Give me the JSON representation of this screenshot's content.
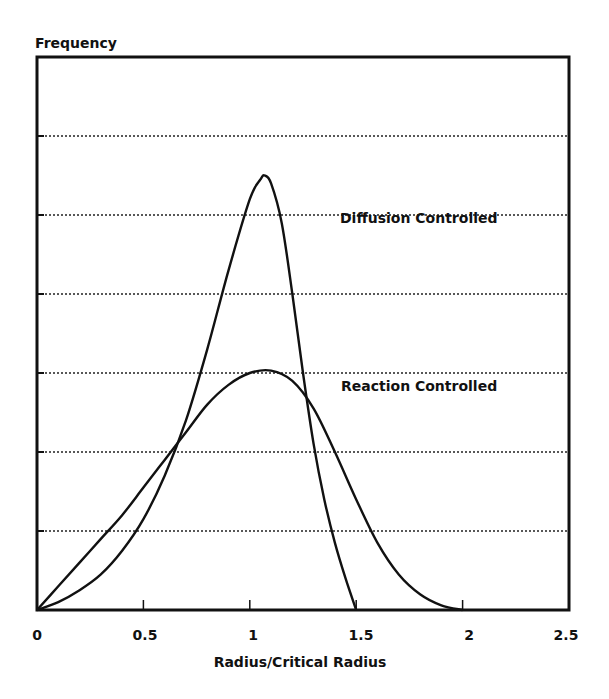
{
  "chart_data": {
    "type": "line",
    "title": "",
    "ylabel": "Frequency",
    "xlabel": "Radius/Critical Radius",
    "xlim": [
      0,
      2.5
    ],
    "ylim": [
      0,
      7
    ],
    "x_ticks": [
      "0",
      "0.5",
      "1",
      "1.5",
      "2",
      "2.5"
    ],
    "y_ticks_labeled": false,
    "grid": {
      "horizontal": true,
      "style": "dotted",
      "count": 6
    },
    "legend": "inline annotations",
    "series": [
      {
        "name": "Diffusion Controlled",
        "x": [
          0,
          0.1,
          0.2,
          0.3,
          0.4,
          0.5,
          0.6,
          0.7,
          0.8,
          0.9,
          1.0,
          1.05,
          1.07,
          1.1,
          1.15,
          1.2,
          1.25,
          1.3,
          1.35,
          1.4,
          1.45,
          1.5
        ],
        "values": [
          0,
          0.1,
          0.25,
          0.45,
          0.75,
          1.15,
          1.7,
          2.4,
          3.3,
          4.3,
          5.2,
          5.45,
          5.5,
          5.4,
          4.9,
          4.0,
          3.0,
          2.1,
          1.4,
          0.85,
          0.4,
          0
        ]
      },
      {
        "name": "Reaction Controlled",
        "x": [
          0,
          0.1,
          0.2,
          0.3,
          0.4,
          0.5,
          0.6,
          0.7,
          0.8,
          0.9,
          1.0,
          1.1,
          1.2,
          1.3,
          1.4,
          1.5,
          1.6,
          1.7,
          1.8,
          1.9,
          2.0
        ],
        "values": [
          0,
          0.3,
          0.6,
          0.9,
          1.2,
          1.55,
          1.9,
          2.25,
          2.6,
          2.85,
          3.0,
          3.03,
          2.9,
          2.55,
          2.0,
          1.4,
          0.85,
          0.45,
          0.2,
          0.06,
          0
        ]
      }
    ],
    "annotations": [
      {
        "text": "Diffusion Controlled",
        "x": 1.41,
        "y": 5.0
      },
      {
        "text": "Reaction Controlled",
        "x": 1.41,
        "y": 2.8
      }
    ]
  },
  "labels": {
    "ylabel": "Frequency",
    "xlabel": "Radius/Critical Radius",
    "diffusion": "Diffusion Controlled",
    "reaction": "Reaction Controlled",
    "xticks": [
      "0",
      "0.5",
      "1",
      "1.5",
      "2",
      "2.5"
    ]
  }
}
